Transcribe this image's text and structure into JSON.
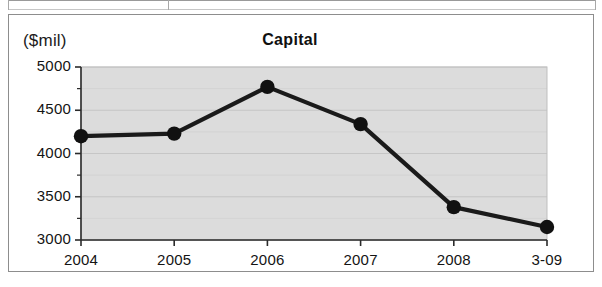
{
  "chart_data": {
    "type": "line",
    "title": "Capital",
    "unit_label": "($mil)",
    "xlabel": "",
    "ylabel": "",
    "categories": [
      "2004",
      "2005",
      "2006",
      "2007",
      "2008",
      "3-09"
    ],
    "values": [
      4200,
      4230,
      4770,
      4340,
      3380,
      3150
    ],
    "series": [
      {
        "name": "Capital",
        "values": [
          4200,
          4230,
          4770,
          4340,
          3380,
          3150
        ]
      }
    ],
    "ylim": [
      3000,
      5000
    ],
    "ytick_labels": [
      "3000",
      "3500",
      "4000",
      "4500",
      "5000"
    ],
    "ytick_values": [
      3000,
      3500,
      4000,
      4500,
      5000
    ],
    "yminor_step": 250,
    "xtick_labels": [
      "2004",
      "2005",
      "2006",
      "2007",
      "2008",
      "3-09"
    ],
    "grid": true,
    "legend": false,
    "legend_position": "none",
    "colors": {
      "line": "#1a1a1a",
      "marker": "#111111",
      "plot_background": "#dcdcdc",
      "gridline": "#bfbfbf",
      "axis": "#2b2b2b",
      "frame": "#8d8d8d",
      "text": "#141414"
    }
  }
}
